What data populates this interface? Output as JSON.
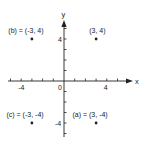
{
  "chart_data": {
    "type": "scatter",
    "title": "",
    "xlabel": "x",
    "ylabel": "y",
    "xlim": [
      -5.5,
      6.2
    ],
    "ylim": [
      -5.4,
      5.6
    ],
    "grid": false,
    "origin_label": "0",
    "x_ticks": [
      -5,
      -4,
      -3,
      -2,
      -1,
      1,
      2,
      3,
      4,
      5
    ],
    "x_tick_labels": [
      {
        "value": -4,
        "label": "-4"
      },
      {
        "value": 4,
        "label": "4"
      }
    ],
    "y_ticks": [
      -5,
      -4,
      -3,
      -2,
      -1,
      1,
      2,
      3,
      4,
      5
    ],
    "y_tick_labels": [
      {
        "value": 4,
        "label": "4"
      },
      {
        "value": -4,
        "label": "-4"
      }
    ],
    "points": [
      {
        "x": -3,
        "y": 4,
        "label": "(b) = (-3, 4)"
      },
      {
        "x": 3,
        "y": 4,
        "label": "(3, 4)"
      },
      {
        "x": -3,
        "y": -4,
        "label": "(c) = (-3, -4)"
      },
      {
        "x": 3,
        "y": -4,
        "label": "(a) = (3, -4)"
      }
    ]
  },
  "colors": {
    "ink": "#222222",
    "background": "#ffffff"
  }
}
